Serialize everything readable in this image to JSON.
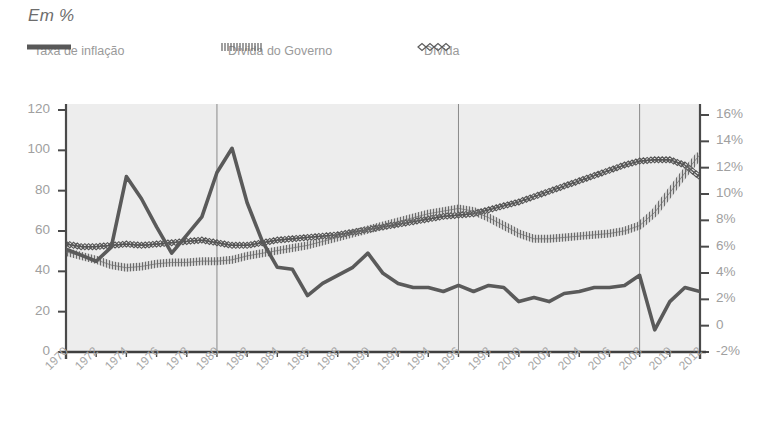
{
  "title": "Em %",
  "legend": {
    "position": "top-left",
    "items": [
      {
        "label": "Taxa de inflação",
        "style": "thick-solid-line",
        "color": "#585858"
      },
      {
        "label": "Dívida do Governo",
        "style": "dense-hatched-line",
        "color": "#6b6b6b"
      },
      {
        "label": "Dívida",
        "style": "diamond-marker-line",
        "color": "#5c5c5c"
      }
    ]
  },
  "axes": {
    "left": {
      "ticks": [
        "0",
        "20",
        "40",
        "60",
        "80",
        "100",
        "120"
      ],
      "min": 0,
      "max": 120
    },
    "right": {
      "ticks": [
        "-2%",
        "0",
        "2%",
        "4%",
        "6%",
        "8%",
        "10%",
        "12%",
        "14%",
        "16%"
      ],
      "min": -2,
      "max": 16
    },
    "x": {
      "ticks": [
        "1970",
        "1972",
        "1974",
        "1976",
        "1978",
        "1980",
        "1982",
        "1984",
        "1986",
        "1988",
        "1990",
        "1992",
        "1994",
        "1996",
        "1998",
        "2000",
        "2002",
        "2004",
        "2006",
        "2008",
        "2010",
        "2012"
      ],
      "min": 1970,
      "max": 2012,
      "gridlines": [
        1980,
        1996,
        2008
      ]
    }
  },
  "colors": {
    "plot_background": "#ededed",
    "axis": "#4a4a4a",
    "gridline": "#8a8a8a",
    "tick_text": "#a0a0a0",
    "title_text": "#6d6d6d",
    "inflation_line": "#5a5a5a",
    "government_debt_line": "#6b6b6b",
    "debt_line": "#555555"
  },
  "chart_data": {
    "type": "line",
    "title": "Em %",
    "xlabel": "",
    "ylabel": "Em %",
    "xlim": [
      1970,
      2012
    ],
    "ylim": [
      0,
      120
    ],
    "y2lim": [
      -2,
      16
    ],
    "grid": "vertical-only",
    "legend_position": "top-left",
    "x": [
      1970,
      1971,
      1972,
      1973,
      1974,
      1975,
      1976,
      1977,
      1978,
      1979,
      1980,
      1981,
      1982,
      1983,
      1984,
      1985,
      1986,
      1987,
      1988,
      1989,
      1990,
      1991,
      1992,
      1993,
      1994,
      1995,
      1996,
      1997,
      1998,
      1999,
      2000,
      2001,
      2002,
      2003,
      2004,
      2005,
      2006,
      2007,
      2008,
      2009,
      2010,
      2011,
      2012
    ],
    "series": [
      {
        "name": "Taxa de inflação",
        "axis": "left",
        "unit": "%",
        "values": [
          51,
          48,
          45,
          52,
          87,
          76,
          62,
          49,
          58,
          67,
          89,
          101,
          74,
          55,
          42,
          41,
          28,
          34,
          38,
          42,
          49,
          39,
          34,
          32,
          32,
          30,
          33,
          30,
          33,
          32,
          25,
          27,
          25,
          29,
          30,
          32,
          32,
          33,
          38,
          11,
          25,
          32,
          30
        ]
      },
      {
        "name": "Dívida do Governo",
        "axis": "right",
        "unit": "%",
        "values": [
          5.6,
          5.3,
          5.0,
          4.6,
          4.4,
          4.5,
          4.7,
          4.8,
          4.8,
          4.9,
          4.9,
          5.0,
          5.3,
          5.5,
          5.7,
          5.9,
          6.1,
          6.4,
          6.7,
          7.0,
          7.3,
          7.6,
          7.9,
          8.2,
          8.5,
          8.7,
          8.9,
          8.7,
          8.2,
          7.6,
          7.0,
          6.6,
          6.6,
          6.7,
          6.8,
          6.9,
          7.0,
          7.2,
          7.6,
          8.6,
          10.1,
          11.6,
          13.0
        ]
      },
      {
        "name": "Dívida",
        "axis": "right",
        "unit": "%",
        "values": [
          6.2,
          6.0,
          6.0,
          6.1,
          6.2,
          6.1,
          6.2,
          6.3,
          6.4,
          6.5,
          6.3,
          6.1,
          6.1,
          6.3,
          6.5,
          6.6,
          6.7,
          6.8,
          6.9,
          7.1,
          7.3,
          7.5,
          7.7,
          7.9,
          8.1,
          8.3,
          8.4,
          8.5,
          8.8,
          9.1,
          9.4,
          9.8,
          10.2,
          10.6,
          11.0,
          11.4,
          11.8,
          12.2,
          12.5,
          12.6,
          12.6,
          12.2,
          11.3
        ]
      }
    ]
  }
}
